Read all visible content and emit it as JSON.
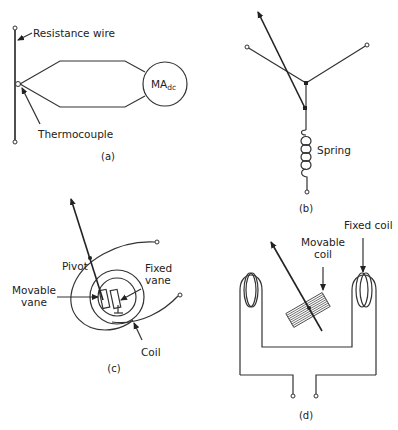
{
  "figure": {
    "panels": [
      {
        "id": "a",
        "caption": "(a)",
        "labels": {
          "resistance_wire": "Resistance wire",
          "thermocouple": "Thermocouple",
          "meter": "MA",
          "meter_subscript": "dc"
        }
      },
      {
        "id": "b",
        "caption": "(b)",
        "labels": {
          "spring": "Spring"
        }
      },
      {
        "id": "c",
        "caption": "(c)",
        "labels": {
          "pivot": "Pivot",
          "movable_vane_1": "Movable",
          "movable_vane_2": "vane",
          "fixed_vane_1": "Fixed",
          "fixed_vane_2": "vane",
          "coil": "Coil"
        }
      },
      {
        "id": "d",
        "caption": "(d)",
        "labels": {
          "movable_coil_1": "Movable",
          "movable_coil_2": "coil",
          "fixed_coil": "Fixed coil"
        }
      }
    ]
  }
}
